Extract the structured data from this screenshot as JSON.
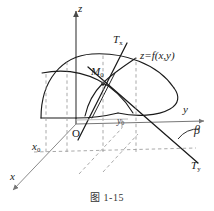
{
  "figure": {
    "caption": "图 1-15",
    "axes": {
      "z_label": "z",
      "y_label": "y",
      "x_label": "x"
    },
    "origin_label": "O",
    "points": {
      "m0_label": "M",
      "m0_sub": "0",
      "x0_label": "x",
      "x0_sub": "0",
      "y0_label": "y",
      "y0_sub": "0"
    },
    "tangents": {
      "tx_label": "T",
      "tx_sub": "x",
      "ty_label": "T",
      "ty_sub": "y"
    },
    "angle_label": "β",
    "surface_equation": "z=f(x,y)",
    "colors": {
      "stroke": "#1a1a1a",
      "dashed": "#8a8a8a",
      "axis": "#555555",
      "background": "#ffffff"
    }
  }
}
